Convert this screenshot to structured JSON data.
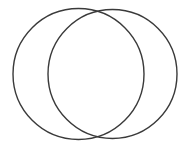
{
  "canvas": {
    "width": 191,
    "height": 148,
    "background_color": "#ffffff"
  },
  "figure": {
    "name": "two-overlapping-circles",
    "stroke_color": "#3a3a3a",
    "stroke_width": 1.4,
    "fill": "none",
    "labels": [],
    "shapes": [
      {
        "id": "left-circle",
        "type": "circle",
        "cx": 78.5,
        "cy": 74,
        "r": 65.5,
        "stroke_color": "#3a3a3a",
        "stroke_width": 1.4,
        "fill": "none"
      },
      {
        "id": "right-circle",
        "type": "circle",
        "cx": 112.5,
        "cy": 74,
        "r": 64.5,
        "stroke_color": "#3a3a3a",
        "stroke_width": 1.4,
        "fill": "none"
      }
    ],
    "intersection_points": [
      {
        "id": "top-intersection",
        "x": 97,
        "y": 12
      },
      {
        "id": "bottom-intersection",
        "x": 97,
        "y": 136
      }
    ]
  }
}
